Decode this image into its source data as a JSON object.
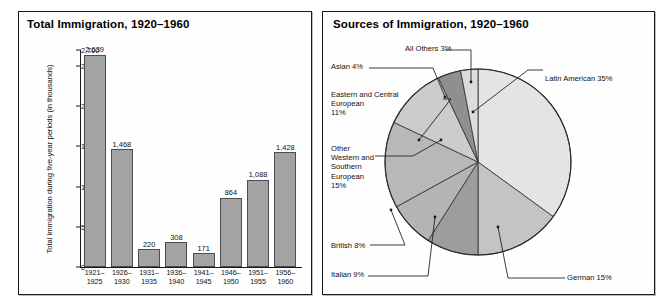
{
  "bar_panel": {
    "title": "Total Immigration, 1920–1960",
    "y_axis_title": "Total immigration during five-year periods (in thousands)"
  },
  "pie_panel": {
    "title": "Sources of Immigration, 1920–1960"
  },
  "labels": {
    "latin_american": "Latin American 35%",
    "german": "German 15%",
    "italian": "Italian 9%",
    "british": "British 8%",
    "other_western_southern": "Other\nWestern and\nSouthern\nEuropean\n15%",
    "eastern_central": "Eastern and Central\nEuropean\n11%",
    "asian": "Asian 4%",
    "all_others": "All Others 3%"
  },
  "chart_data": [
    {
      "type": "bar",
      "title": "Total Immigration, 1920–1960",
      "xlabel": "",
      "ylabel": "Total immigration during five-year periods (in thousands)",
      "categories": [
        "1921–\n1925",
        "1926–\n1930",
        "1931–\n1935",
        "1936–\n1940",
        "1941–\n1945",
        "1946–\n1950",
        "1951–\n1955",
        "1956–\n1960"
      ],
      "values": [
        2639,
        1468,
        220,
        308,
        171,
        864,
        1088,
        1428
      ],
      "value_labels": [
        "2,639",
        "1,468",
        "220",
        "308",
        "171",
        "864",
        "1,088",
        "1,428"
      ],
      "ylim": [
        0,
        2700
      ],
      "yticks": [
        0,
        500,
        1000,
        1500,
        2000,
        2500,
        2700
      ],
      "ytick_labels": [
        "0",
        "500",
        "1,000",
        "1,500",
        "2,000",
        "2,500",
        "2,700"
      ],
      "grid": false,
      "legend": "none",
      "bar_color": "#a3a3a3",
      "bar_edge_color": "#4d4d4d"
    },
    {
      "type": "pie",
      "title": "Sources of Immigration, 1920–1960",
      "start_angle_deg": 0,
      "direction": "clockwise",
      "legend": "callout-labels",
      "slices": [
        {
          "name": "Latin American",
          "value": 35,
          "label": "Latin American 35%",
          "color": "#e4e4e4"
        },
        {
          "name": "German",
          "value": 15,
          "label": "German 15%",
          "color": "#c4c4c4"
        },
        {
          "name": "Italian",
          "value": 9,
          "label": "Italian 9%",
          "color": "#9d9d9d"
        },
        {
          "name": "British",
          "value": 8,
          "label": "British 8%",
          "color": "#b4b4b4"
        },
        {
          "name": "Other Western and Southern European",
          "value": 15,
          "label": "Other Western and Southern European 15%",
          "color": "#b8b8b8"
        },
        {
          "name": "Eastern and Central European",
          "value": 11,
          "label": "Eastern and Central European 11%",
          "color": "#cccccc"
        },
        {
          "name": "Asian",
          "value": 4,
          "label": "Asian 4%",
          "color": "#8f8f8f"
        },
        {
          "name": "All Others",
          "value": 3,
          "label": "All Others 3%",
          "color": "#dcdcdc"
        }
      ]
    }
  ]
}
